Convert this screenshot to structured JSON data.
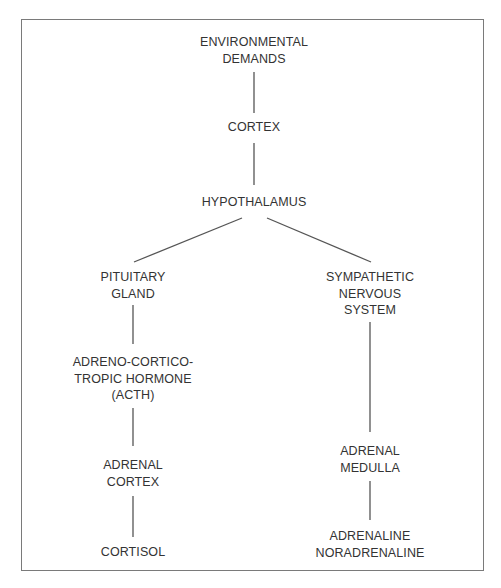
{
  "diagram": {
    "title": "",
    "colors": {
      "background": "#ffffff",
      "frame": "#7a7a7a",
      "connector": "#555555",
      "text": "#333333"
    },
    "nodes": {
      "environmental_demands": {
        "lines": [
          "ENVIRONMENTAL",
          "DEMANDS"
        ]
      },
      "cortex": {
        "lines": [
          "CORTEX"
        ]
      },
      "hypothalamus": {
        "lines": [
          "HYPOTHALAMUS"
        ]
      },
      "pituitary_gland": {
        "lines": [
          "PITUITARY",
          "GLAND"
        ]
      },
      "acth": {
        "lines": [
          "ADRENO-CORTICO-",
          "TROPIC HORMONE",
          "(ACTH)"
        ]
      },
      "adrenal_cortex": {
        "lines": [
          "ADRENAL",
          "CORTEX"
        ]
      },
      "cortisol": {
        "lines": [
          "CORTISOL"
        ]
      },
      "sympathetic_nervous_system": {
        "lines": [
          "SYMPATHETIC",
          "NERVOUS",
          "SYSTEM"
        ]
      },
      "adrenal_medulla": {
        "lines": [
          "ADRENAL",
          "MEDULLA"
        ]
      },
      "adrenaline_noradrenaline": {
        "lines": [
          "ADRENALINE",
          "NORADRENALINE"
        ]
      }
    },
    "edges": [
      {
        "from": "environmental_demands",
        "to": "cortex"
      },
      {
        "from": "cortex",
        "to": "hypothalamus"
      },
      {
        "from": "hypothalamus",
        "to": "pituitary_gland"
      },
      {
        "from": "hypothalamus",
        "to": "sympathetic_nervous_system"
      },
      {
        "from": "pituitary_gland",
        "to": "acth"
      },
      {
        "from": "acth",
        "to": "adrenal_cortex"
      },
      {
        "from": "adrenal_cortex",
        "to": "cortisol"
      },
      {
        "from": "sympathetic_nervous_system",
        "to": "adrenal_medulla"
      },
      {
        "from": "adrenal_medulla",
        "to": "adrenaline_noradrenaline"
      }
    ]
  }
}
